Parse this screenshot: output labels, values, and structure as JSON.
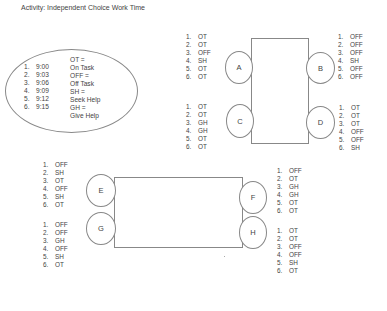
{
  "title": "Activity:  Independent Choice Work Time",
  "legend": {
    "times": [
      {
        "num": "1.",
        "time": "9:00"
      },
      {
        "num": "2.",
        "time": "9:03"
      },
      {
        "num": "3.",
        "time": "9:06"
      },
      {
        "num": "4.",
        "time": "9:09"
      },
      {
        "num": "5.",
        "time": "9:12"
      },
      {
        "num": "6.",
        "time": "9:15"
      }
    ],
    "key": [
      "OT =",
      "On Task",
      "OFF =",
      "Off Task",
      "SH =",
      "Seek Help",
      "GH =",
      "Give Help"
    ]
  },
  "seats": {
    "A": {
      "label": "A",
      "obs": [
        "OT",
        "OT",
        "OFF",
        "SH",
        "OT",
        "OT"
      ]
    },
    "B": {
      "label": "B",
      "obs": [
        "OFF",
        "OFF",
        "OFF",
        "SH",
        "OFF",
        "OFF"
      ]
    },
    "C": {
      "label": "C",
      "obs": [
        "OT",
        "OT",
        "GH",
        "GH",
        "OT",
        "OT"
      ]
    },
    "D": {
      "label": "D",
      "obs": [
        "OT",
        "OT",
        "OT",
        "OFF",
        "OFF",
        "SH"
      ]
    },
    "E": {
      "label": "E",
      "obs": [
        "OFF",
        "SH",
        "OT",
        "OFF",
        "SH",
        "OT"
      ]
    },
    "F": {
      "label": "F",
      "obs": [
        "OFF",
        "OT",
        "GH",
        "GH",
        "OT",
        "OT"
      ]
    },
    "G": {
      "label": "G",
      "obs": [
        "OFF",
        "OFF",
        "GH",
        "OFF",
        "SH",
        "OT"
      ]
    },
    "H": {
      "label": "H",
      "obs": [
        "OT",
        "OT",
        "OFF",
        "OFF",
        "SH",
        "OT"
      ]
    }
  },
  "nums": [
    "1.",
    "2.",
    "3.",
    "4.",
    "5.",
    "6."
  ]
}
